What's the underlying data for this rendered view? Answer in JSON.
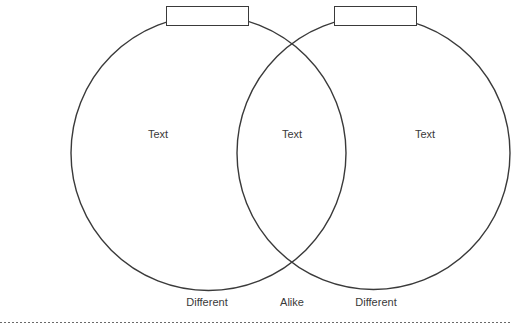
{
  "diagram": {
    "type": "venn",
    "colors": {
      "stroke": "#3a3a3a",
      "text": "#3a3a3a",
      "background": "#ffffff",
      "dashed_line": "#6a6a6a"
    },
    "circles": [
      {
        "name": "left",
        "label_box": "",
        "text": "Text"
      },
      {
        "name": "right",
        "label_box": "",
        "text": "Text"
      }
    ],
    "overlap_text": "Text",
    "bottom_labels": {
      "left": "Different",
      "center": "Alike",
      "right": "Different"
    }
  }
}
